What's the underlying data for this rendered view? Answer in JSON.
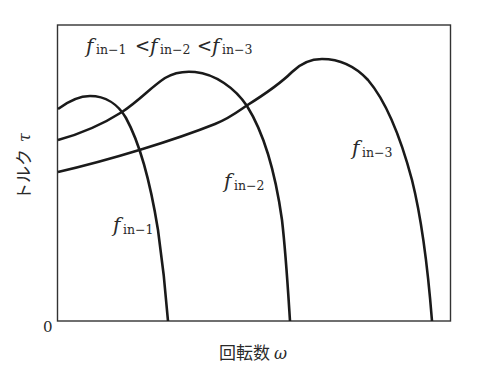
{
  "figure": {
    "type": "torque-speed characteristic diagram",
    "y_axis_label": "トルク τ",
    "y_axis_label_jp": "トルク",
    "y_axis_symbol": "τ",
    "x_axis_label_jp": "回転数",
    "x_axis_symbol": "ω",
    "origin_label": "0",
    "inequality": {
      "f": "f",
      "sub1": "in−1",
      "sub2": "in−2",
      "sub3": "in−3",
      "op": "<"
    },
    "curves": [
      {
        "name": "f_in-1",
        "f": "f",
        "sub": "in−1",
        "start_torque_px": 109,
        "peak": [
          89,
          96
        ],
        "end_speed_px": 168
      },
      {
        "name": "f_in-2",
        "f": "f",
        "sub": "in−2",
        "start_torque_px": 140,
        "peak": [
          190,
          72
        ],
        "end_speed_px": 290
      },
      {
        "name": "f_in-3",
        "f": "f",
        "sub": "in−3",
        "start_torque_px": 172,
        "peak": [
          320,
          58
        ],
        "end_speed_px": 432
      }
    ],
    "colors": {
      "line": "#1a1a1a",
      "frame": "#333333",
      "text": "#2a2a2a"
    }
  }
}
